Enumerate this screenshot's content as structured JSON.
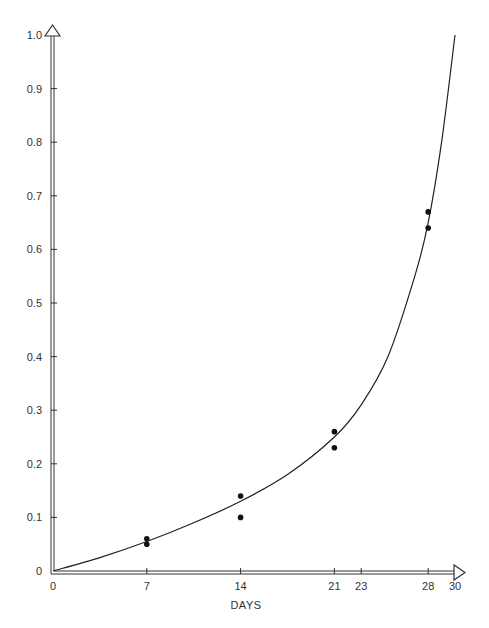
{
  "chart_data": {
    "type": "scatter",
    "title": "",
    "xlabel": "DAYS",
    "ylabel": "",
    "xlim": [
      0,
      30
    ],
    "ylim": [
      0,
      1.0
    ],
    "grid": false,
    "legend": null,
    "x_ticks": [
      0,
      7,
      14,
      21,
      23,
      28,
      30
    ],
    "y_ticks": [
      0,
      0.1,
      0.2,
      0.3,
      0.4,
      0.5,
      0.6,
      0.7,
      0.8,
      0.9,
      1.0
    ],
    "x_tick_labels": [
      "0",
      "7",
      "14",
      "21",
      "23",
      "28",
      "30"
    ],
    "y_tick_labels": [
      "0",
      "0.1",
      "0.2",
      "0.3",
      "0.4",
      "0.5",
      "0.6",
      "0.7",
      "0.8",
      "0.9",
      "1.0"
    ],
    "series": [
      {
        "name": "observed",
        "kind": "scatter",
        "points": [
          {
            "x": 7,
            "y": 0.06
          },
          {
            "x": 7,
            "y": 0.05
          },
          {
            "x": 14,
            "y": 0.14
          },
          {
            "x": 14,
            "y": 0.1
          },
          {
            "x": 21,
            "y": 0.26
          },
          {
            "x": 21,
            "y": 0.23
          },
          {
            "x": 28,
            "y": 0.67
          },
          {
            "x": 28,
            "y": 0.64
          }
        ]
      },
      {
        "name": "fitted curve",
        "kind": "line",
        "points": [
          {
            "x": 0,
            "y": 0.0
          },
          {
            "x": 3.5,
            "y": 0.025
          },
          {
            "x": 7,
            "y": 0.055
          },
          {
            "x": 10.5,
            "y": 0.09
          },
          {
            "x": 14,
            "y": 0.13
          },
          {
            "x": 17.5,
            "y": 0.18
          },
          {
            "x": 21,
            "y": 0.25
          },
          {
            "x": 23,
            "y": 0.31
          },
          {
            "x": 25,
            "y": 0.4
          },
          {
            "x": 27,
            "y": 0.55
          },
          {
            "x": 28,
            "y": 0.65
          },
          {
            "x": 29,
            "y": 0.8
          },
          {
            "x": 30,
            "y": 1.0
          }
        ]
      }
    ],
    "annotations": []
  }
}
